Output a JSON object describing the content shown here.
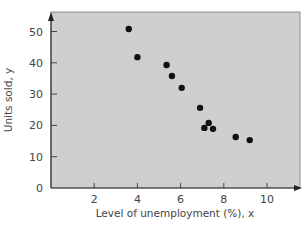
{
  "chart_data": {
    "type": "scatter",
    "title": "",
    "xlabel": "Level of unemployment (%), x",
    "ylabel": "Units sold, y",
    "xlim": [
      0,
      11.5
    ],
    "ylim": [
      0,
      55
    ],
    "xticks": [
      2,
      4,
      6,
      8,
      10
    ],
    "yticks": [
      0,
      10,
      20,
      30,
      40,
      50
    ],
    "grid": false,
    "legend": null,
    "background": "#cfcfcf",
    "point_color": "#111111",
    "series": [
      {
        "name": "Units sold vs unemployment",
        "points": [
          {
            "x": 3.6,
            "y": 50.8
          },
          {
            "x": 4.0,
            "y": 41.8
          },
          {
            "x": 5.35,
            "y": 39.3
          },
          {
            "x": 5.6,
            "y": 35.8
          },
          {
            "x": 6.05,
            "y": 32.0
          },
          {
            "x": 6.9,
            "y": 25.6
          },
          {
            "x": 7.3,
            "y": 20.8
          },
          {
            "x": 7.1,
            "y": 19.2
          },
          {
            "x": 7.5,
            "y": 18.9
          },
          {
            "x": 8.55,
            "y": 16.3
          },
          {
            "x": 9.2,
            "y": 15.3
          }
        ]
      }
    ]
  }
}
